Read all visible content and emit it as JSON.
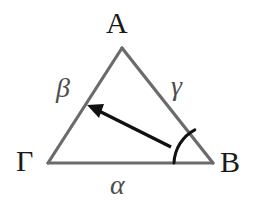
{
  "figure": {
    "type": "geometry-diagram",
    "shape": "triangle",
    "background_color": "#ffffff",
    "edge_color": "#6b6b6b",
    "arrow_color": "#111111",
    "arc_color": "#111111",
    "vertex_label_color": "#1a1a1a",
    "side_label_color": "#4d4d4d",
    "vertices": [
      {
        "name": "A",
        "label": "A",
        "x": 122,
        "y": 48
      },
      {
        "name": "Gamma",
        "label": "Γ",
        "x": 48,
        "y": 163
      },
      {
        "name": "B",
        "label": "B",
        "x": 213,
        "y": 163
      }
    ],
    "sides": [
      {
        "name": "alpha",
        "label": "α",
        "between": "Γ-B",
        "x": 120,
        "y": 186
      },
      {
        "name": "beta",
        "label": "β",
        "between": "A-Γ",
        "x": 66,
        "y": 92
      },
      {
        "name": "gamma",
        "label": "γ",
        "between": "A-B",
        "x": 181,
        "y": 90
      }
    ],
    "angle_arc": {
      "name": "angle-at-B",
      "vertex": "B",
      "radius": 39,
      "start_x": 174,
      "start_y": 163,
      "end_x": 195,
      "end_y": 130
    },
    "arrow": {
      "name": "direction-arrow",
      "from_x": 171,
      "from_y": 147,
      "to_x": 87,
      "to_y": 105,
      "head_length": 16,
      "head_width": 11
    }
  }
}
